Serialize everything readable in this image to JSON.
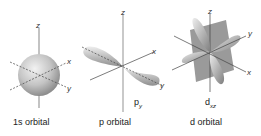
{
  "orbitals": [
    {
      "caption": "1s orbital",
      "axes": {
        "z": "z",
        "x": "x",
        "y": "y"
      }
    },
    {
      "caption": "p orbital",
      "sublabel_main": "p",
      "sublabel_sub": "y",
      "axes": {
        "z": "z",
        "x": "x",
        "y": "y"
      }
    },
    {
      "caption": "d orbital",
      "sublabel_main": "d",
      "sublabel_sub": "xz",
      "axes": {
        "z": "z",
        "x": "x",
        "y": "y"
      }
    }
  ],
  "colors": {
    "axis": "#444444",
    "shape_light": "#e6e6e6",
    "shape_dark": "#8c8c8c",
    "plane": "#9a9a9a"
  }
}
